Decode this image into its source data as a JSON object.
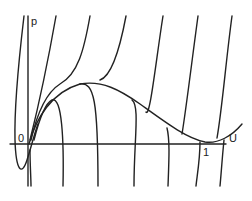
{
  "diagram": {
    "type": "phase-portrait",
    "axes": {
      "x_label": "U",
      "y_label": "p",
      "origin_label": "0",
      "x_tick_label": "1"
    },
    "separatrix": "curve from origin rising to a maximum then descending to tangent at U=1",
    "trajectory_count": 10,
    "colors": {
      "stroke": "#222222",
      "background": "#ffffff"
    }
  }
}
